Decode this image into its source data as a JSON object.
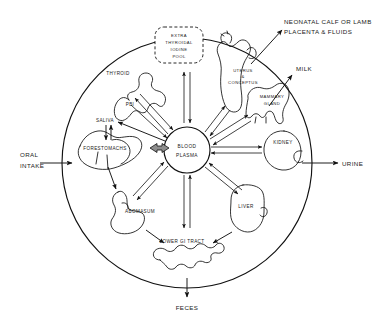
{
  "diagram": {
    "center": {
      "line1": "BLOOD",
      "line2": "PLASMA"
    },
    "pool_box": {
      "line1": "EXTRA",
      "line2": "THYROIDAL",
      "line3": "IODINE",
      "line4": "POOL"
    },
    "organs": [
      {
        "id": "thyroid",
        "label": "THYROID"
      },
      {
        "id": "uterus-conceptus",
        "line1": "UTERUS",
        "line2": "&",
        "line3": "CONCEPTUS"
      },
      {
        "id": "mammary-gland",
        "line1": "MAMMARY",
        "line2": "GLAND"
      },
      {
        "id": "kidney",
        "label": "KIDNEY"
      },
      {
        "id": "liver",
        "label": "LIVER"
      },
      {
        "id": "lower-gi-tract",
        "label": "LOWER GI TRACT"
      },
      {
        "id": "abomasum",
        "label": "ABOMASUM"
      },
      {
        "id": "forestomachs",
        "label": "FORESTOMACHS"
      },
      {
        "id": "saliva",
        "label": "SALIVA"
      },
      {
        "id": "pbi",
        "label": "PBI"
      }
    ],
    "external": [
      {
        "id": "oral-intake",
        "line1": "ORAL",
        "line2": "INTAKE"
      },
      {
        "id": "neonatal",
        "line1": "NEONATAL CALF OR LAMB",
        "line2": "PLACENTA & FLUIDS"
      },
      {
        "id": "milk",
        "label": "MILK"
      },
      {
        "id": "urine",
        "label": "URINE"
      },
      {
        "id": "feces",
        "label": "FECES"
      }
    ],
    "colors": {
      "ink": "#111111",
      "fill": "#ffffff",
      "shaded_arrow": "#8d8d8d"
    }
  }
}
